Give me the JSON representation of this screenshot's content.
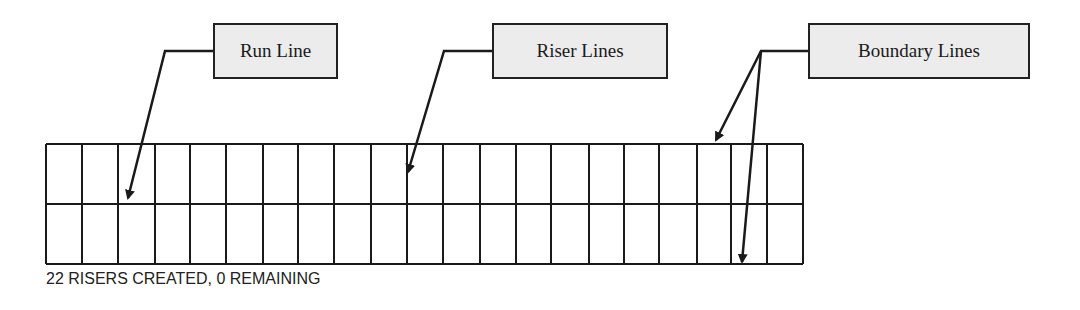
{
  "labels": [
    {
      "id": "run-line",
      "text": "Run Line",
      "x": 213,
      "y": 23,
      "w": 125,
      "h": 56
    },
    {
      "id": "riser-lines",
      "text": "Riser Lines",
      "x": 492,
      "y": 23,
      "w": 176,
      "h": 56
    },
    {
      "id": "boundary-lines",
      "text": "Boundary Lines",
      "x": 808,
      "y": 23,
      "w": 222,
      "h": 56
    }
  ],
  "grid": {
    "left": 46,
    "top": 144,
    "right": 803,
    "bottom": 264,
    "middle": 204,
    "columns": 21,
    "column_lines_x": [
      46,
      82,
      118,
      155,
      190,
      226,
      263,
      298,
      334,
      371,
      407,
      443,
      480,
      516,
      551,
      589,
      624,
      659,
      697,
      731,
      767,
      803
    ]
  },
  "leaders": [
    {
      "id": "run-line-leader",
      "points": [
        [
          213,
          51
        ],
        [
          165,
          51
        ],
        [
          128,
          198
        ]
      ]
    },
    {
      "id": "riser-lines-leader",
      "points": [
        [
          492,
          51
        ],
        [
          444,
          51
        ],
        [
          408,
          172
        ]
      ]
    },
    {
      "id": "boundary-lines-leader-a",
      "points": [
        [
          808,
          51
        ],
        [
          761,
          51
        ],
        [
          716,
          140
        ]
      ]
    },
    {
      "id": "boundary-lines-leader-b",
      "points": [
        [
          761,
          51
        ],
        [
          742,
          262
        ]
      ]
    }
  ],
  "status": {
    "text": "22 RISERS CREATED, 0 REMAINING"
  },
  "colors": {
    "line": "#1a1a1a",
    "label_fill": "#ececec",
    "label_border": "#222222"
  }
}
